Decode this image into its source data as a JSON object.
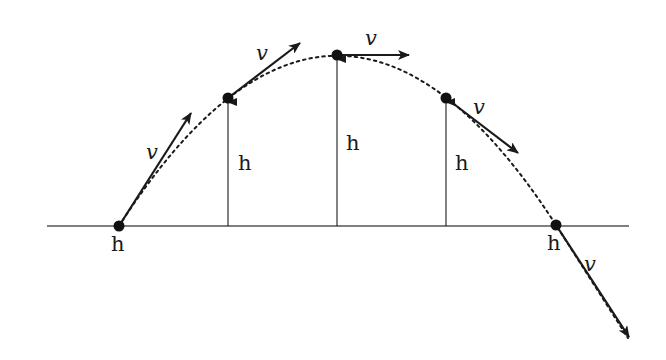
{
  "diagram": {
    "colors": {
      "background": "#ffffff",
      "stroke": "#1a1a1a",
      "ground": "#555555"
    },
    "ground_line": {
      "x1": 47,
      "y1": 226,
      "x2": 629,
      "y2": 226
    },
    "trajectory": {
      "style": "dotted",
      "path": "M119,226 Q337,-114 556,225 L628,338"
    },
    "points": [
      {
        "id": "launch",
        "x": 119,
        "y": 226,
        "velocity": {
          "x2": 191,
          "y2": 113,
          "label": "v",
          "label_x": 146,
          "label_y": 159
        },
        "height": null,
        "h_label": {
          "text": "h",
          "x": 111,
          "y": 251
        }
      },
      {
        "id": "rising",
        "x": 228,
        "y": 98,
        "velocity": {
          "x2": 300,
          "y2": 43,
          "label": "v",
          "label_x": 256,
          "label_y": 60
        },
        "height": {
          "x": 228,
          "y1": 226,
          "y2": 102
        },
        "h_label": {
          "text": "h",
          "x": 238,
          "y": 170
        }
      },
      {
        "id": "apex",
        "x": 337,
        "y": 55,
        "velocity": {
          "x2": 409,
          "y2": 55,
          "label": "v",
          "label_x": 365,
          "label_y": 45
        },
        "height": {
          "x": 337,
          "y1": 226,
          "y2": 59
        },
        "h_label": {
          "text": "h",
          "x": 346,
          "y": 150
        }
      },
      {
        "id": "falling",
        "x": 446,
        "y": 98,
        "velocity": {
          "x2": 518,
          "y2": 153,
          "label": "v",
          "label_x": 473,
          "label_y": 114
        },
        "height": {
          "x": 446,
          "y1": 226,
          "y2": 102
        },
        "h_label": {
          "text": "h",
          "x": 455,
          "y": 170
        }
      },
      {
        "id": "landing",
        "x": 556,
        "y": 225,
        "velocity": {
          "x2": 629,
          "y2": 337,
          "label": "v",
          "label_x": 584,
          "label_y": 271
        },
        "height": null,
        "h_label": {
          "text": "h",
          "x": 547,
          "y": 250
        }
      }
    ]
  }
}
